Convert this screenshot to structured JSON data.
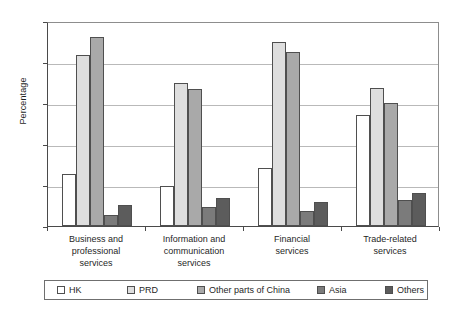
{
  "chart_data": {
    "type": "bar",
    "title": "",
    "subtitle": "",
    "xlabel": "",
    "ylabel": "Percentage",
    "ylim": [
      0,
      25
    ],
    "yticks": [
      0,
      5,
      10,
      15,
      20,
      25
    ],
    "ytick_labels": [
      "0",
      "5",
      "10",
      "15",
      "20",
      "25"
    ],
    "grid": true,
    "legend_position": "bottom",
    "grouping": "grouped",
    "categories": [
      "Business and professional services",
      "Information and communication services",
      "Financial services",
      "Trade-related services"
    ],
    "category_label_lines": [
      [
        "Business and",
        "professional",
        "services"
      ],
      [
        "Information and",
        "communication",
        "services"
      ],
      [
        "Financial",
        "services"
      ],
      [
        "Trade-related",
        "services"
      ]
    ],
    "series": [
      {
        "name": "HK",
        "color": "#ffffff",
        "values": [
          6.4,
          4.9,
          7.1,
          13.5
        ]
      },
      {
        "name": "PRD",
        "color": "#dedede",
        "values": [
          20.8,
          17.5,
          22.4,
          16.8
        ]
      },
      {
        "name": "Other parts of China",
        "color": "#a9a9a9",
        "values": [
          23.1,
          16.7,
          21.2,
          15.0
        ]
      },
      {
        "name": "Asia",
        "color": "#7b7b7b",
        "values": [
          1.4,
          2.3,
          1.8,
          3.2
        ]
      },
      {
        "name": "Others",
        "color": "#5c5c5c",
        "values": [
          2.6,
          3.4,
          2.9,
          4.0
        ]
      }
    ]
  },
  "axis": {
    "y_title": "Percentage"
  },
  "legend": {
    "items": [
      {
        "label": "HK"
      },
      {
        "label": "PRD"
      },
      {
        "label": "Other parts of China"
      },
      {
        "label": "Asia"
      },
      {
        "label": "Others"
      }
    ]
  }
}
